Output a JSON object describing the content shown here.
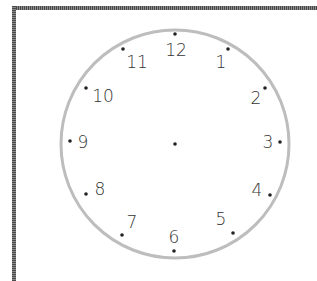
{
  "clock": {
    "center": {
      "x": 175,
      "y": 144
    },
    "radius": 114,
    "ring_color": "#bdbdbd",
    "dot_color": "#222222",
    "numeral_color": "#333333",
    "hours": [
      {
        "label": "12",
        "dot": [
          175,
          34
        ],
        "text": [
          176,
          56
        ]
      },
      {
        "label": "1",
        "dot": [
          228,
          49
        ],
        "text": [
          221,
          68
        ]
      },
      {
        "label": "2",
        "dot": [
          265,
          88
        ],
        "text": [
          256,
          104
        ]
      },
      {
        "label": "3",
        "dot": [
          280,
          142
        ],
        "text": [
          268,
          148
        ]
      },
      {
        "label": "4",
        "dot": [
          270,
          195
        ],
        "text": [
          257,
          196
        ]
      },
      {
        "label": "5",
        "dot": [
          233,
          233
        ],
        "text": [
          221,
          225
        ]
      },
      {
        "label": "6",
        "dot": [
          174,
          251
        ],
        "text": [
          174,
          243
        ]
      },
      {
        "label": "7",
        "dot": [
          122,
          235
        ],
        "text": [
          132,
          228
        ]
      },
      {
        "label": "8",
        "dot": [
          86,
          194
        ],
        "text": [
          100,
          195
        ]
      },
      {
        "label": "9",
        "dot": [
          70,
          141
        ],
        "text": [
          83,
          148
        ]
      },
      {
        "label": "10",
        "dot": [
          86,
          88
        ],
        "text": [
          103,
          102
        ]
      },
      {
        "label": "11",
        "dot": [
          123,
          49
        ],
        "text": [
          137,
          68
        ]
      }
    ]
  }
}
